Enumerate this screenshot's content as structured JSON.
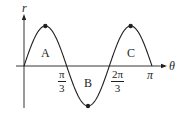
{
  "chart_data": {
    "type": "line",
    "title": "",
    "xlabel": "θ",
    "ylabel": "r",
    "function": "r = sin(3θ)",
    "x_range": [
      0,
      3.14159
    ],
    "ylim": [
      -1,
      1
    ],
    "x_ticks": [
      {
        "value": 1.0472,
        "label_num": "π",
        "label_den": "3"
      },
      {
        "value": 2.0944,
        "label_num": "2π",
        "label_den": "3"
      },
      {
        "value": 3.14159,
        "label": "π"
      }
    ],
    "extrema_points": [
      {
        "x": 0.5236,
        "y": 1
      },
      {
        "x": 1.5708,
        "y": -1
      },
      {
        "x": 2.618,
        "y": 1
      }
    ],
    "regions": [
      {
        "label": "A",
        "x_from": 0,
        "x_to": 1.0472,
        "sign": "positive"
      },
      {
        "label": "B",
        "x_from": 1.0472,
        "x_to": 2.0944,
        "sign": "negative"
      },
      {
        "label": "C",
        "x_from": 2.0944,
        "x_to": 3.14159,
        "sign": "positive"
      }
    ],
    "grid": false,
    "legend": "none"
  },
  "labels": {
    "y_axis": "r",
    "x_axis": "θ",
    "tick_pi_over_3_num": "π",
    "tick_pi_over_3_den": "3",
    "tick_2pi_over_3_num": "2π",
    "tick_2pi_over_3_den": "3",
    "tick_pi": "π",
    "region_a": "A",
    "region_b": "B",
    "region_c": "C"
  },
  "colors": {
    "ink": "#231f20",
    "background": "#ffffff"
  }
}
